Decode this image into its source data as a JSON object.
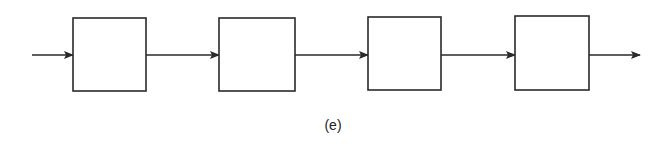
{
  "diagram": {
    "type": "block-chain",
    "blocks": [
      {
        "id": "block-1",
        "label": ""
      },
      {
        "id": "block-2",
        "label": ""
      },
      {
        "id": "block-3",
        "label": ""
      },
      {
        "id": "block-4",
        "label": ""
      }
    ],
    "connections": [
      {
        "from": "input",
        "to": "block-1"
      },
      {
        "from": "block-1",
        "to": "block-2"
      },
      {
        "from": "block-2",
        "to": "block-3"
      },
      {
        "from": "block-3",
        "to": "block-4"
      },
      {
        "from": "block-4",
        "to": "output"
      }
    ],
    "caption": "(e)",
    "stroke_color": "#2a2a2a"
  }
}
